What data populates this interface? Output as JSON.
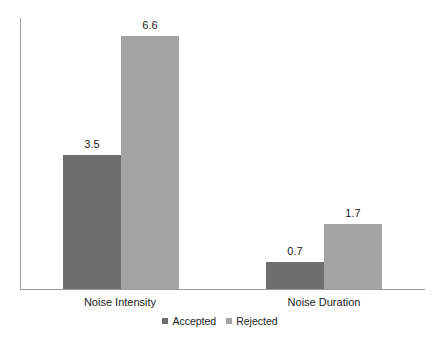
{
  "chart_data": {
    "type": "bar",
    "title": "",
    "xlabel": "",
    "ylabel": "",
    "categories": [
      "Noise Intensity",
      "Noise Duration"
    ],
    "series": [
      {
        "name": "Accepted",
        "values": [
          3.5,
          0.7
        ],
        "color": "#6e6e6e"
      },
      {
        "name": "Rejected",
        "values": [
          6.6,
          1.7
        ],
        "color": "#a4a4a4"
      }
    ],
    "data_labels": {
      "Noise Intensity": {
        "Accepted": "3.5",
        "Rejected": "6.6"
      },
      "Noise Duration": {
        "Accepted": "0.7",
        "Rejected": "1.7"
      }
    },
    "ylim": [
      0,
      7
    ],
    "grid": false,
    "legend_position": "bottom",
    "y_tick_labels_visible": false
  },
  "labels": {
    "cat0": "Noise Intensity",
    "cat1": "Noise Duration",
    "v00": "3.5",
    "v01": "6.6",
    "v10": "0.7",
    "v11": "1.7",
    "legend0": "Accepted",
    "legend1": "Rejected"
  }
}
